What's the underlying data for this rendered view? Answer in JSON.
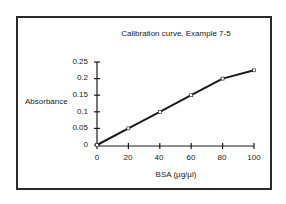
{
  "chart_data": {
    "type": "line",
    "title": "Calibration curve, Example 7-5",
    "xlabel": "BSA (µg/µl)",
    "ylabel": "Absorbance",
    "x": [
      0,
      20,
      40,
      60,
      80,
      100
    ],
    "series": [
      {
        "name": "Absorbance",
        "values": [
          0,
          0.05,
          0.1,
          0.15,
          0.2,
          0.225
        ]
      }
    ],
    "xlim": [
      0,
      100
    ],
    "ylim": [
      0,
      0.25
    ],
    "x_ticks": [
      "0",
      "20",
      "40",
      "60",
      "80",
      "100"
    ],
    "y_ticks": [
      "0",
      "0.05",
      "0.1",
      "0.15",
      "0.2",
      "0.25"
    ],
    "grid": false,
    "legend": "none",
    "line_color": "#1a1a1a"
  }
}
